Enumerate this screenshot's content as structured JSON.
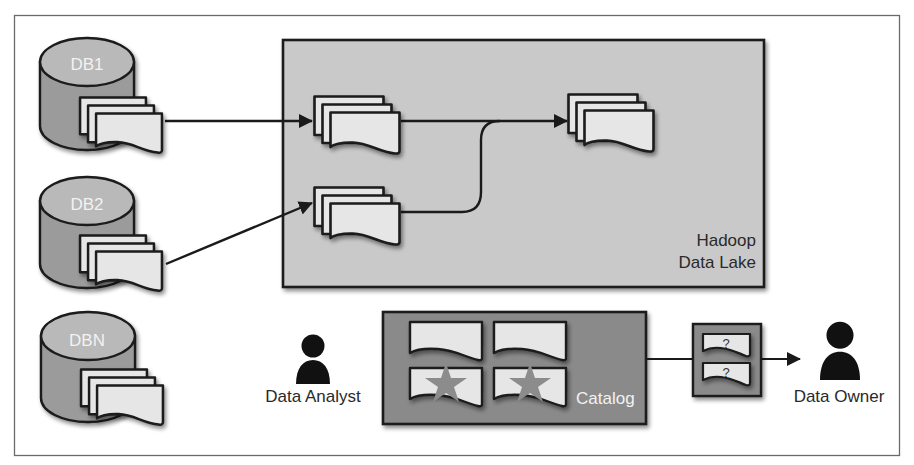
{
  "colors": {
    "frame": "#6a6a6a",
    "lake_fill": "#c9c9c9",
    "catalog_fill": "#8a8a8a",
    "doc_fill": "#e6e6e6",
    "cyl_top": "#b9b9b9",
    "cyl_body": "#9b9b9b",
    "star": "#8c8c8c",
    "ink": "#1a1a1a"
  },
  "sources": [
    {
      "label": "DB1"
    },
    {
      "label": "DB2"
    },
    {
      "label": "DBN"
    }
  ],
  "data_lake": {
    "label_line1": "Hadoop",
    "label_line2": "Data Lake"
  },
  "catalog": {
    "label": "Catalog"
  },
  "question_box": {
    "mark1": "?",
    "mark2": "?"
  },
  "actors": {
    "analyst": {
      "label": "Data Analyst",
      "icon": "person-icon"
    },
    "owner": {
      "label": "Data Owner",
      "icon": "person-icon"
    }
  },
  "flows": [
    {
      "from": "DB1",
      "to": "lake-stack-1"
    },
    {
      "from": "DB2",
      "to": "lake-stack-2"
    },
    {
      "from": "lake-stack-1",
      "to": "lake-stack-3"
    },
    {
      "from": "lake-stack-2",
      "to": "lake-stack-3"
    },
    {
      "from": "catalog",
      "to": "Data Owner",
      "via": "question-box"
    }
  ]
}
